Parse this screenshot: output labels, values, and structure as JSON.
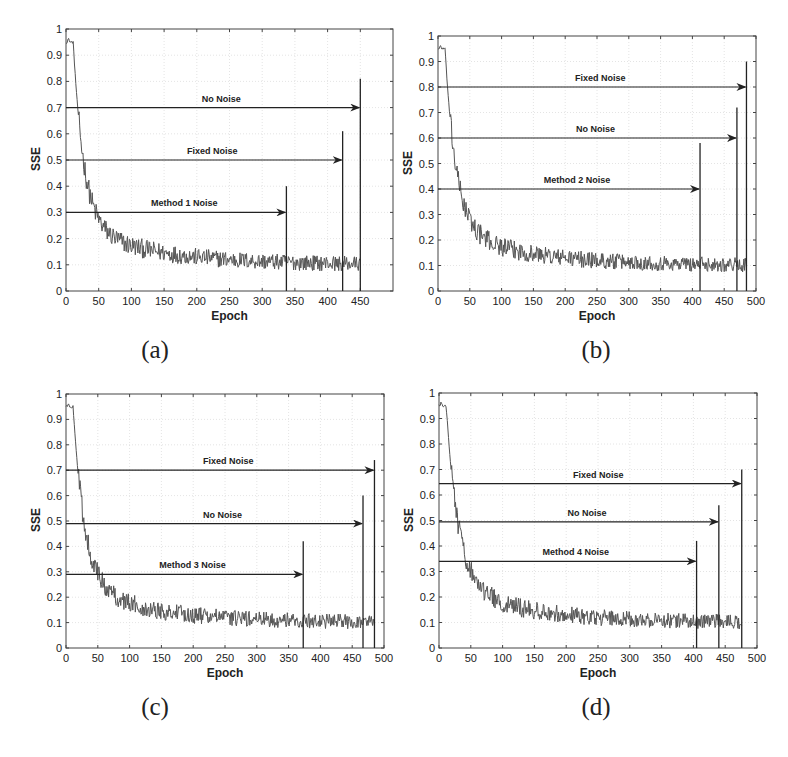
{
  "chart_data": [
    {
      "type": "line",
      "caption": "(a)",
      "xlabel": "Epoch",
      "ylabel": "SSE",
      "xlim": [
        0,
        500
      ],
      "ylim": [
        0,
        1
      ],
      "xticks": [
        0,
        50,
        100,
        150,
        200,
        250,
        300,
        350,
        400,
        450
      ],
      "yticks": [
        0,
        0.1,
        0.2,
        0.3,
        0.4,
        0.5,
        0.6,
        0.7,
        0.8,
        0.9,
        1
      ],
      "ytick_labels": [
        "0",
        "0.1",
        "0.2",
        "0.3",
        "0.4",
        "0.5",
        "0.6",
        "0.7",
        "0.8",
        "0.9",
        "1"
      ],
      "grid": true,
      "series": [
        {
          "name": "SSE",
          "end_epoch": 450,
          "start": 0.95,
          "plateau_until": 8,
          "final": 0.1,
          "decay": 40
        }
      ],
      "annotations": [
        {
          "label": "No Noise",
          "arrow_y": 0.7,
          "end_epoch": 450,
          "line_top": 0.81
        },
        {
          "label": "Fixed Noise",
          "arrow_y": 0.5,
          "end_epoch": 423,
          "line_top": 0.61
        },
        {
          "label": "Method 1 Noise",
          "arrow_y": 0.3,
          "end_epoch": 337,
          "line_top": 0.4
        }
      ]
    },
    {
      "type": "line",
      "caption": "(b)",
      "xlabel": "Epoch",
      "ylabel": "SSE",
      "xlim": [
        0,
        500
      ],
      "ylim": [
        0,
        1
      ],
      "xticks": [
        0,
        50,
        100,
        150,
        200,
        250,
        300,
        350,
        400,
        450,
        500
      ],
      "yticks": [
        0,
        0.1,
        0.2,
        0.3,
        0.4,
        0.5,
        0.6,
        0.7,
        0.8,
        0.9,
        1
      ],
      "ytick_labels": [
        "0",
        "0.1",
        "0.2",
        "0.3",
        "0.4",
        "0.5",
        "0.6",
        "0.7",
        "0.8",
        "0.9",
        "1"
      ],
      "grid": true,
      "series": [
        {
          "name": "SSE",
          "end_epoch": 485,
          "start": 0.95,
          "plateau_until": 8,
          "final": 0.1,
          "decay": 42
        }
      ],
      "annotations": [
        {
          "label": "Fixed Noise",
          "arrow_y": 0.8,
          "end_epoch": 485,
          "line_top": 0.9
        },
        {
          "label": "No Noise",
          "arrow_y": 0.6,
          "end_epoch": 470,
          "line_top": 0.72
        },
        {
          "label": "Method 2 Noise",
          "arrow_y": 0.4,
          "end_epoch": 412,
          "line_top": 0.58
        }
      ]
    },
    {
      "type": "line",
      "caption": "(c)",
      "xlabel": "Epoch",
      "ylabel": "SSE",
      "xlim": [
        0,
        500
      ],
      "ylim": [
        0,
        1
      ],
      "xticks": [
        0,
        50,
        100,
        150,
        200,
        250,
        300,
        350,
        400,
        450,
        500
      ],
      "yticks": [
        0,
        0.1,
        0.2,
        0.3,
        0.4,
        0.5,
        0.6,
        0.7,
        0.8,
        0.9,
        1
      ],
      "ytick_labels": [
        "0",
        "0.1",
        "0.2",
        "0.3",
        "0.4",
        "0.5",
        "0.6",
        "0.7",
        "0.8",
        "0.9",
        "1"
      ],
      "grid": true,
      "series": [
        {
          "name": "SSE",
          "end_epoch": 485,
          "start": 0.95,
          "plateau_until": 8,
          "final": 0.1,
          "decay": 45
        }
      ],
      "annotations": [
        {
          "label": "Fixed Noise",
          "arrow_y": 0.7,
          "end_epoch": 485,
          "line_top": 0.74
        },
        {
          "label": "No Noise",
          "arrow_y": 0.49,
          "end_epoch": 467,
          "line_top": 0.6
        },
        {
          "label": "Method 3 Noise",
          "arrow_y": 0.29,
          "end_epoch": 373,
          "line_top": 0.42
        }
      ]
    },
    {
      "type": "line",
      "caption": "(d)",
      "xlabel": "Epoch",
      "ylabel": "SSE",
      "xlim": [
        0,
        500
      ],
      "ylim": [
        0,
        1
      ],
      "xticks": [
        0,
        50,
        100,
        150,
        200,
        250,
        300,
        350,
        400,
        450,
        500
      ],
      "yticks": [
        0,
        0.1,
        0.2,
        0.3,
        0.4,
        0.5,
        0.6,
        0.7,
        0.8,
        0.9,
        1
      ],
      "ytick_labels": [
        "0",
        "0.1",
        "0.2",
        "0.3",
        "0.4",
        "0.5",
        "0.6",
        "0.7",
        "0.8",
        "0.9",
        "1"
      ],
      "grid": true,
      "series": [
        {
          "name": "SSE",
          "end_epoch": 476,
          "start": 0.95,
          "plateau_until": 8,
          "final": 0.1,
          "decay": 48
        }
      ],
      "annotations": [
        {
          "label": "Fixed Noise",
          "arrow_y": 0.645,
          "end_epoch": 476,
          "line_top": 0.7
        },
        {
          "label": "No Noise",
          "arrow_y": 0.495,
          "end_epoch": 440,
          "line_top": 0.56
        },
        {
          "label": "Method 4 Noise",
          "arrow_y": 0.34,
          "end_epoch": 405,
          "line_top": 0.42
        }
      ]
    }
  ],
  "layout": [
    {
      "left": 66,
      "top": 29,
      "right": 393,
      "bottom": 291,
      "caption_x": 125,
      "caption_y": 336
    },
    {
      "left": 438,
      "top": 36,
      "right": 756,
      "bottom": 291,
      "caption_x": 566,
      "caption_y": 336
    },
    {
      "left": 66,
      "top": 394,
      "right": 384,
      "bottom": 648,
      "caption_x": 125,
      "caption_y": 693
    },
    {
      "left": 439,
      "top": 393,
      "right": 757,
      "bottom": 648,
      "caption_x": 566,
      "caption_y": 693
    }
  ]
}
